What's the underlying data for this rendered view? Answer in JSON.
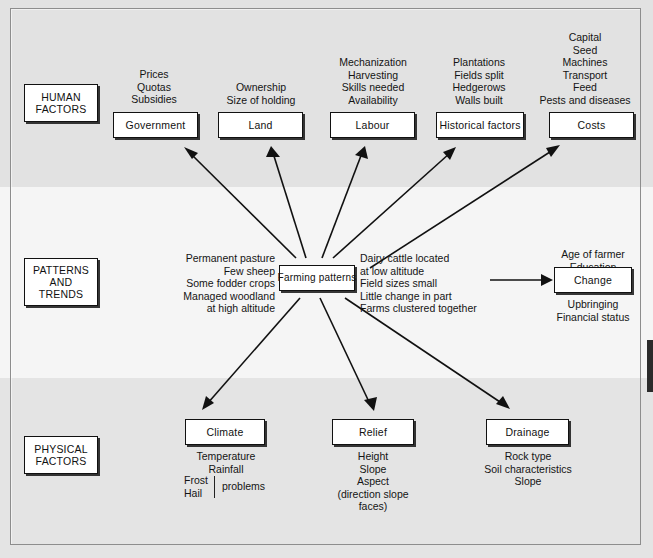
{
  "diagram": {
    "bands": [
      {
        "name": "human",
        "label_line1": "HUMAN",
        "label_line2": "FACTORS"
      },
      {
        "name": "patterns",
        "label_line1": "PATTERNS",
        "label_line2": "AND",
        "label_line3": "TRENDS"
      },
      {
        "name": "physical",
        "label_line1": "PHYSICAL",
        "label_line2": "FACTORS"
      }
    ],
    "human_factors": [
      {
        "box": "Government",
        "above": [
          "Prices",
          "Quotas",
          "Subsidies"
        ]
      },
      {
        "box": "Land",
        "above": [
          "Ownership",
          "Size of holding"
        ]
      },
      {
        "box": "Labour",
        "above": [
          "Mechanization",
          "Harvesting",
          "Skills needed",
          "Availability"
        ]
      },
      {
        "box": "Historical factors",
        "above": [
          "Plantations",
          "Fields split",
          "Hedgerows",
          "Walls built"
        ]
      },
      {
        "box": "Costs",
        "above": [
          "Capital",
          "Seed",
          "Machines",
          "Transport",
          "Feed",
          "Pests and diseases"
        ]
      }
    ],
    "centre": {
      "box": "Farming patterns",
      "left_text": [
        "Permanent pasture",
        "Few sheep",
        "Some fodder crops",
        "Managed woodland",
        "at high altitude"
      ],
      "right_text": [
        "Dairy cattle located",
        "at low altitude",
        "Field sizes small",
        "Little change in part",
        "Farms clustered together"
      ]
    },
    "change": {
      "box": "Change",
      "above": [
        "Age of farmer",
        "Education"
      ],
      "below": [
        "Upbringing",
        "Financial status"
      ]
    },
    "physical_factors": [
      {
        "box": "Climate",
        "below": [
          "Temperature",
          "Rainfall"
        ],
        "split": {
          "left": [
            "Frost",
            "Hail"
          ],
          "right": "problems"
        }
      },
      {
        "box": "Relief",
        "below": [
          "Height",
          "Slope",
          "Aspect",
          "(direction slope",
          "faces)"
        ]
      },
      {
        "box": "Drainage",
        "below": [
          "Rock type",
          "Soil characteristics",
          "Slope"
        ]
      }
    ],
    "colors": {
      "band_top": "#e2e2e2",
      "band_mid": "#f5f5f5",
      "band_bottom": "#e4e4e4",
      "box_fill": "#ffffff",
      "ink": "#111111"
    }
  }
}
